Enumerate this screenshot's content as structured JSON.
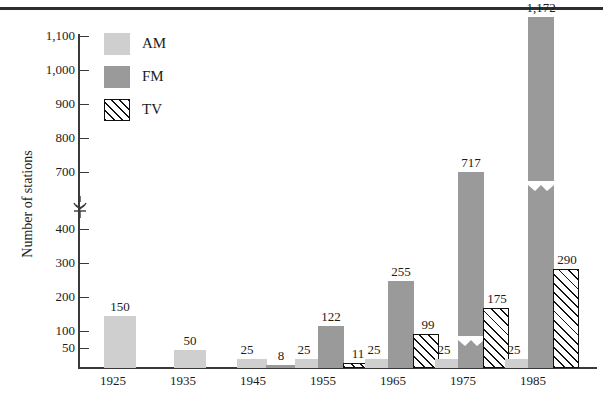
{
  "chart_data": {
    "type": "bar",
    "title": "",
    "xlabel": "",
    "ylabel": "Number of stations",
    "categories": [
      "1925",
      "1935",
      "1945",
      "1955",
      "1965",
      "1975",
      "1985"
    ],
    "series": [
      {
        "name": "AM",
        "color": "#cfcfcf",
        "values": [
          150,
          50,
          25,
          25,
          25,
          25,
          25
        ]
      },
      {
        "name": "FM",
        "color": "#9a9a9a",
        "values": [
          null,
          null,
          8,
          122,
          255,
          717,
          1172
        ]
      },
      {
        "name": "TV",
        "color": "#ffffff",
        "pattern": "diagonal-hatch",
        "values": [
          null,
          null,
          null,
          11,
          99,
          175,
          290
        ]
      }
    ],
    "y_ticks": [
      "50",
      "100",
      "200",
      "300",
      "400",
      "700",
      "800",
      "900",
      "1,000",
      "1,100"
    ],
    "y_axis_break": {
      "between": [
        "700",
        "400"
      ],
      "symbol": "squiggle"
    },
    "bar_breaks": [
      {
        "category": "1975",
        "series": "FM"
      },
      {
        "category": "1985",
        "series": "FM"
      }
    ],
    "grid": false,
    "legend_position": "top-left",
    "data_labels": {
      "1925": {
        "AM": "150"
      },
      "1935": {
        "AM": "50"
      },
      "1945": {
        "AM": "25",
        "FM": "8"
      },
      "1955": {
        "AM": "25",
        "FM": "122",
        "TV": "11"
      },
      "1965": {
        "AM": "25",
        "FM": "255",
        "TV": "99"
      },
      "1975": {
        "AM": "25",
        "FM": "717",
        "TV": "175"
      },
      "1985": {
        "AM": "25",
        "FM": "1,172",
        "TV": "290"
      }
    }
  },
  "axis": {
    "y_label": "Number of stations",
    "y_ticks": [
      {
        "label": "1,100",
        "top": 36
      },
      {
        "label": "1,000",
        "top": 70
      },
      {
        "label": "900",
        "top": 104
      },
      {
        "label": "800",
        "top": 138
      },
      {
        "label": "700",
        "top": 172
      },
      {
        "label": "400",
        "top": 229
      },
      {
        "label": "300",
        "top": 263
      },
      {
        "label": "200",
        "top": 297
      },
      {
        "label": "100",
        "top": 331
      },
      {
        "label": "50",
        "top": 348
      }
    ],
    "x_ticks": [
      {
        "label": "1925",
        "left": 88
      },
      {
        "label": "1935",
        "left": 158
      },
      {
        "label": "1945",
        "left": 228
      },
      {
        "label": "1955",
        "left": 298
      },
      {
        "label": "1965",
        "left": 368
      },
      {
        "label": "1975",
        "left": 438
      },
      {
        "label": "1985",
        "left": 508
      }
    ]
  },
  "legend": {
    "items": [
      {
        "label": "AM",
        "swatch": "am"
      },
      {
        "label": "FM",
        "swatch": "fm"
      },
      {
        "label": "TV",
        "swatch": "tv"
      }
    ]
  },
  "bars": [
    {
      "year": "1925",
      "series": "AM",
      "label": "150",
      "left": 104,
      "width": 32,
      "height": 52,
      "label_left": 104,
      "label_width": 32,
      "label_bottom": 90
    },
    {
      "year": "1935",
      "series": "AM",
      "label": "50",
      "left": 174,
      "width": 32,
      "height": 18,
      "label_left": 174,
      "label_width": 32,
      "label_bottom": 56
    },
    {
      "year": "1945",
      "series": "AM",
      "label": "25",
      "left": 237,
      "width": 30,
      "height": 9,
      "label_left": 232,
      "label_width": 30,
      "label_bottom": 47
    },
    {
      "year": "1945",
      "series": "FM",
      "label": "8",
      "left": 266,
      "width": 30,
      "height": 3,
      "label_left": 266,
      "label_width": 30,
      "label_bottom": 41
    },
    {
      "year": "1955",
      "series": "AM",
      "label": "25",
      "left": 295,
      "width": 24,
      "height": 9,
      "label_left": 289,
      "label_width": 30,
      "label_bottom": 47
    },
    {
      "year": "1955",
      "series": "FM",
      "label": "122",
      "left": 318,
      "width": 26,
      "height": 42,
      "label_left": 315,
      "label_width": 32,
      "label_bottom": 80
    },
    {
      "year": "1955",
      "series": "TV",
      "label": "11",
      "left": 343,
      "width": 26,
      "height": 5,
      "label_left": 343,
      "label_width": 30,
      "label_bottom": 43
    },
    {
      "year": "1965",
      "series": "AM",
      "label": "25",
      "left": 365,
      "width": 24,
      "height": 9,
      "label_left": 359,
      "label_width": 30,
      "label_bottom": 47
    },
    {
      "year": "1965",
      "series": "FM",
      "label": "255",
      "left": 388,
      "width": 26,
      "height": 87,
      "label_left": 385,
      "label_width": 32,
      "label_bottom": 125
    },
    {
      "year": "1965",
      "series": "TV",
      "label": "99",
      "left": 413,
      "width": 26,
      "height": 34,
      "label_left": 413,
      "label_width": 30,
      "label_bottom": 72
    },
    {
      "year": "1975",
      "series": "AM",
      "label": "25",
      "left": 435,
      "width": 24,
      "height": 9,
      "label_left": 429,
      "label_width": 30,
      "label_bottom": 47
    },
    {
      "year": "1975",
      "series": "FM",
      "label": "717",
      "left": 458,
      "width": 26,
      "height": 196,
      "label_left": 455,
      "label_width": 32,
      "label_bottom": 234
    },
    {
      "year": "1975",
      "series": "TV",
      "label": "175",
      "left": 483,
      "width": 26,
      "height": 60,
      "label_left": 481,
      "label_width": 32,
      "label_bottom": 98
    },
    {
      "year": "1985",
      "series": "AM",
      "label": "25",
      "left": 505,
      "width": 24,
      "height": 9,
      "label_left": 499,
      "label_width": 30,
      "label_bottom": 47
    },
    {
      "year": "1985",
      "series": "FM",
      "label": "1,172",
      "left": 528,
      "width": 26,
      "height": 351,
      "label_left": 521,
      "label_width": 40,
      "label_bottom": 389
    },
    {
      "year": "1985",
      "series": "TV",
      "label": "290",
      "left": 553,
      "width": 26,
      "height": 99,
      "label_left": 551,
      "label_width": 32,
      "label_bottom": 137
    }
  ]
}
